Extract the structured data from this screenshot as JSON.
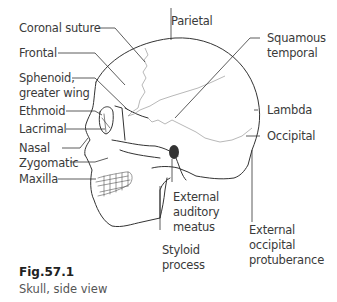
{
  "figure": {
    "number": "Fig.57.1",
    "caption": "Skull, side view"
  },
  "labels": {
    "coronal_suture": "Coronal suture",
    "frontal": "Frontal",
    "sphenoid_1": "Sphenoid,",
    "sphenoid_2": "greater wing",
    "ethmoid": "Ethmoid",
    "lacrimal": "Lacrimal",
    "nasal": "Nasal",
    "zygomatic": "Zygomatic",
    "maxilla": "Maxilla",
    "parietal": "Parietal",
    "squamous_1": "Squamous",
    "squamous_2": "temporal",
    "lambda": "Lambda",
    "occipital": "Occipital",
    "ext_aud_1": "External",
    "ext_aud_2": "auditory",
    "ext_aud_3": "meatus",
    "styloid_1": "Styloid",
    "styloid_2": "process",
    "ext_occ_1": "External",
    "ext_occ_2": "occipital",
    "ext_occ_3": "protuberance"
  }
}
